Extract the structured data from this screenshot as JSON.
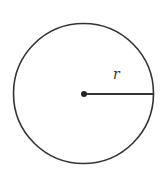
{
  "diagram": {
    "type": "circle-with-radius",
    "radius_label": "r",
    "circle": {
      "cx": 83.5,
      "cy": 93.5,
      "r": 70
    },
    "center_point": {
      "cx": 84,
      "cy": 94,
      "r": 3
    },
    "radius_line": {
      "x1": 84,
      "y1": 94,
      "x2": 153.5,
      "y2": 94
    },
    "label_position": {
      "x": 113,
      "y": 79
    },
    "colors": {
      "stroke": "#333333",
      "background": "#ffffff"
    }
  }
}
